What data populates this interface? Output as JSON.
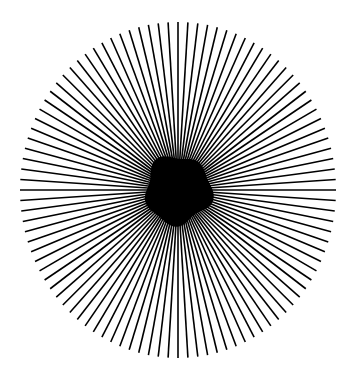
{
  "figure": {
    "type": "radial-starburst",
    "background": "#ffffff",
    "line_color": "#000000",
    "center": [
      178,
      190
    ],
    "radius_x": 158,
    "radius_y": 168,
    "spoke_count": 100,
    "stroke_width": 1.6,
    "core_blob": {
      "center": [
        178,
        190
      ],
      "radius_x": 33,
      "radius_y": 34,
      "color": "#000000"
    }
  }
}
